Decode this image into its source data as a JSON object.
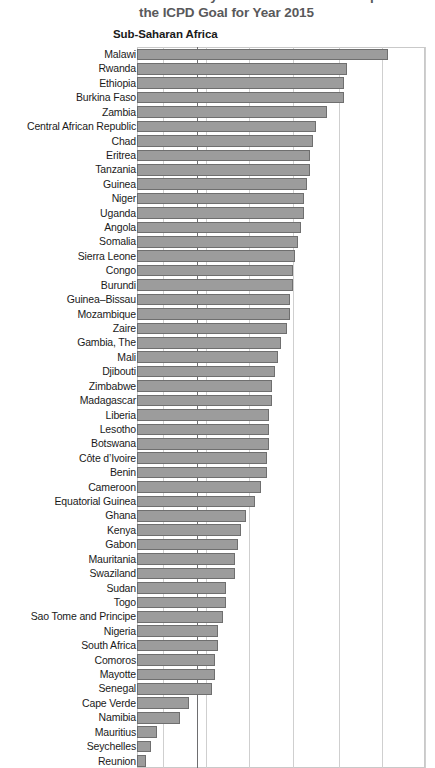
{
  "title": {
    "line1": "Percent of Births Attended by Trained Personnel Compared to",
    "line2": "the ICPD Goal for Year 2015"
  },
  "region_heading": "Sub-Saharan Africa",
  "chart_data": {
    "type": "bar",
    "orientation": "horizontal",
    "title": "the ICPD Goal for Year 2015",
    "xlabel": "",
    "ylabel": "",
    "xlim": [
      0,
      100
    ],
    "grid": true,
    "gridlines": [
      9,
      21,
      24,
      39,
      54,
      70,
      85,
      100
    ],
    "reference_line": 21,
    "bar_color": "#9c9c9c",
    "bar_edge_color": "#6f6f6f",
    "legend": "none",
    "categories": [
      "Malawi",
      "Rwanda",
      "Ethiopia",
      "Burkina Faso",
      "Zambia",
      "Central African Republic",
      "Chad",
      "Eritrea",
      "Tanzania",
      "Guinea",
      "Niger",
      "Uganda",
      "Angola",
      "Somalia",
      "Sierra Leone",
      "Congo",
      "Burundi",
      "Guinea–Bissau",
      "Mozambique",
      "Zaire",
      "Gambia, The",
      "Mali",
      "Djibouti",
      "Zimbabwe",
      "Madagascar",
      "Liberia",
      "Lesotho",
      "Botswana",
      "Côte d’Ivoire",
      "Benin",
      "Cameroon",
      "Equatorial Guinea",
      "Ghana",
      "Kenya",
      "Gabon",
      "Mauritania",
      "Swaziland",
      "Sudan",
      "Togo",
      "Sao Tome and Principe",
      "Nigeria",
      "South Africa",
      "Comoros",
      "Mayotte",
      "Senegal",
      "Cape Verde",
      "Namibia",
      "Mauritius",
      "Seychelles",
      "Reunion"
    ],
    "values": [
      87,
      73,
      72,
      72,
      66,
      62,
      61,
      60,
      60,
      59,
      58,
      58,
      57,
      56,
      55,
      54,
      54,
      53,
      53,
      52,
      50,
      49,
      48,
      47,
      47,
      46,
      46,
      46,
      45,
      45,
      43,
      41,
      38,
      36,
      35,
      34,
      34,
      31,
      31,
      30,
      28,
      28,
      27,
      27,
      26,
      18,
      15,
      7,
      5,
      3
    ]
  }
}
